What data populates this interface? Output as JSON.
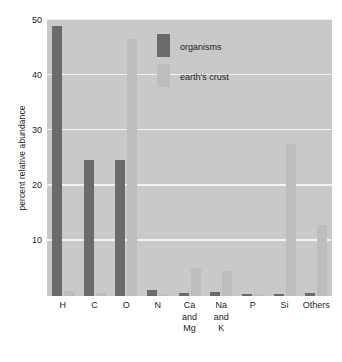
{
  "chart_data": {
    "type": "bar",
    "title": "",
    "xlabel": "",
    "ylabel": "percent relative abundance",
    "ylim": [
      0,
      50
    ],
    "yticks": [
      10,
      20,
      30,
      40,
      50
    ],
    "ytick_labels": [
      "10",
      "20",
      "30",
      "40",
      "50"
    ],
    "grid": true,
    "legend_position": "upper center",
    "categories": [
      "H",
      "C",
      "O",
      "N",
      "Ca\nand\nMg",
      "Na\nand\nK",
      "P",
      "Si",
      "Others"
    ],
    "series": [
      {
        "name": "organisms",
        "color": "#6b6b6b",
        "values": [
          49.0,
          24.6,
          24.6,
          1.0,
          0.5,
          0.8,
          0.4,
          0.3,
          0.6
        ]
      },
      {
        "name": "earth's crust",
        "color": "#bdbdbd",
        "values": [
          0.9,
          0.5,
          46.5,
          0.3,
          5.0,
          4.5,
          0.2,
          27.5,
          12.9
        ]
      }
    ]
  },
  "style": {
    "plot_background": "#c9c9c9",
    "gridline_color": "#f2f2f2",
    "page_background": "#ffffff",
    "text_color": "#1c1c1c"
  }
}
